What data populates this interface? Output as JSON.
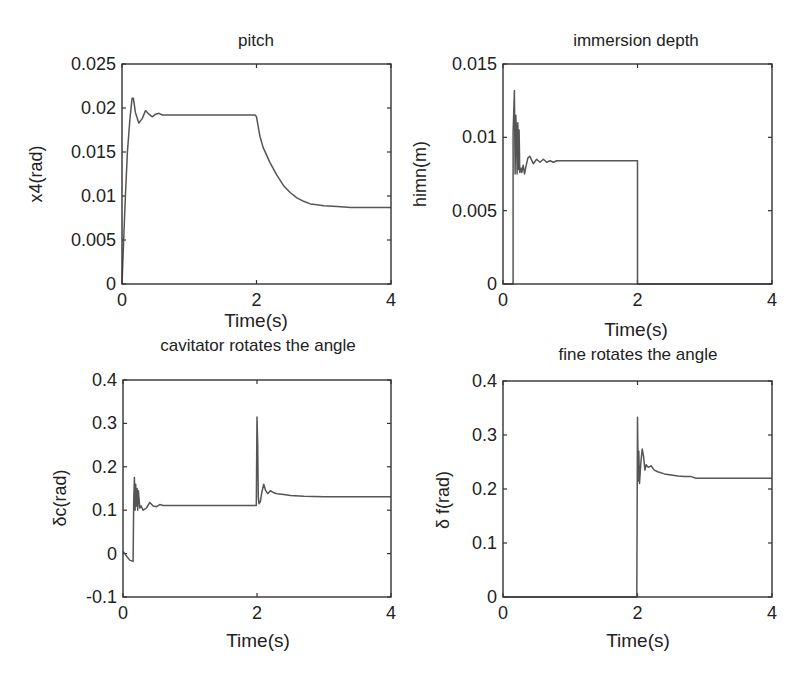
{
  "chart_data": [
    {
      "type": "line",
      "title": "pitch",
      "xlabel": "Time(s)",
      "ylabel": "x4(rad)",
      "xlim": [
        0,
        4
      ],
      "ylim": [
        0,
        0.025
      ],
      "xticks": [
        "0",
        "2",
        "4"
      ],
      "yticks": [
        "0",
        "0.005",
        "0.01",
        "0.015",
        "0.02",
        "0.025"
      ],
      "grid": false,
      "series": [
        {
          "name": "x4",
          "x": [
            0,
            0.03,
            0.05,
            0.08,
            0.12,
            0.15,
            0.17,
            0.2,
            0.25,
            0.3,
            0.35,
            0.4,
            0.45,
            0.5,
            0.55,
            0.6,
            0.7,
            1.0,
            1.5,
            1.98,
            2.0,
            2.05,
            2.1,
            2.2,
            2.3,
            2.4,
            2.5,
            2.6,
            2.7,
            2.8,
            2.9,
            3.0,
            3.2,
            3.4,
            3.6,
            4.0
          ],
          "y": [
            0,
            0.006,
            0.01,
            0.015,
            0.019,
            0.0211,
            0.0211,
            0.0195,
            0.0183,
            0.0188,
            0.0197,
            0.0193,
            0.019,
            0.0193,
            0.0194,
            0.0192,
            0.0192,
            0.0192,
            0.0192,
            0.0192,
            0.019,
            0.0168,
            0.0155,
            0.0138,
            0.0124,
            0.0112,
            0.0104,
            0.0098,
            0.0094,
            0.0091,
            0.009,
            0.0089,
            0.0088,
            0.0087,
            0.0087,
            0.0087
          ]
        }
      ]
    },
    {
      "type": "line",
      "title": "immersion depth",
      "xlabel": "Time(s)",
      "ylabel": "himn(m)",
      "xlim": [
        0,
        4
      ],
      "ylim": [
        0,
        0.015
      ],
      "xticks": [
        "0",
        "2",
        "4"
      ],
      "yticks": [
        "0",
        "0.005",
        "0.01",
        "0.015"
      ],
      "grid": false,
      "series": [
        {
          "name": "himn",
          "x": [
            0,
            0.15,
            0.15,
            0.17,
            0.18,
            0.19,
            0.2,
            0.21,
            0.22,
            0.23,
            0.24,
            0.25,
            0.27,
            0.28,
            0.3,
            0.32,
            0.34,
            0.37,
            0.4,
            0.45,
            0.5,
            0.55,
            0.6,
            0.65,
            0.7,
            0.75,
            0.8,
            0.9,
            1.2,
            1.6,
            2.0,
            2.0,
            4.0
          ],
          "y": [
            0,
            0,
            0.0103,
            0.0132,
            0.0075,
            0.0115,
            0.0103,
            0.0075,
            0.011,
            0.0078,
            0.0105,
            0.0076,
            0.0079,
            0.0076,
            0.0081,
            0.0075,
            0.008,
            0.0086,
            0.0087,
            0.0082,
            0.0085,
            0.0083,
            0.0085,
            0.0083,
            0.0084,
            0.0083,
            0.0084,
            0.0084,
            0.0084,
            0.0084,
            0.0084,
            0,
            0
          ]
        }
      ]
    },
    {
      "type": "line",
      "title": "cavitator rotates the angle",
      "xlabel": "Time(s)",
      "ylabel": "δc(rad)",
      "xlim": [
        0,
        4
      ],
      "ylim": [
        -0.1,
        0.4
      ],
      "xticks": [
        "0",
        "2",
        "4"
      ],
      "yticks": [
        "-0.1",
        "0",
        "0.1",
        "0.2",
        "0.3",
        "0.4"
      ],
      "grid": false,
      "series": [
        {
          "name": "δc",
          "x": [
            0,
            0.05,
            0.1,
            0.15,
            0.16,
            0.17,
            0.18,
            0.19,
            0.2,
            0.21,
            0.22,
            0.23,
            0.25,
            0.27,
            0.3,
            0.35,
            0.4,
            0.45,
            0.5,
            0.55,
            0.6,
            0.65,
            1.0,
            1.5,
            1.99,
            2.0,
            2.01,
            2.02,
            2.03,
            2.05,
            2.07,
            2.1,
            2.13,
            2.16,
            2.2,
            2.25,
            2.3,
            2.4,
            2.5,
            2.7,
            3.0,
            3.5,
            4.0
          ],
          "y": [
            0.005,
            -0.005,
            -0.015,
            -0.018,
            0.12,
            0.175,
            0.1,
            0.16,
            0.11,
            0.15,
            0.1,
            0.145,
            0.105,
            0.11,
            0.1,
            0.105,
            0.118,
            0.11,
            0.108,
            0.113,
            0.111,
            0.111,
            0.111,
            0.111,
            0.111,
            0.315,
            0.25,
            0.13,
            0.115,
            0.12,
            0.14,
            0.16,
            0.145,
            0.138,
            0.145,
            0.14,
            0.138,
            0.136,
            0.134,
            0.132,
            0.131,
            0.131,
            0.131
          ]
        }
      ]
    },
    {
      "type": "line",
      "title": "fine rotates the angle",
      "xlabel": "Time(s)",
      "ylabel": "δ f(rad)",
      "xlim": [
        0,
        4
      ],
      "ylim": [
        0,
        0.4
      ],
      "xticks": [
        "0",
        "2",
        "4"
      ],
      "yticks": [
        "0",
        "0.1",
        "0.2",
        "0.3",
        "0.4"
      ],
      "grid": false,
      "series": [
        {
          "name": "δf",
          "x": [
            0,
            1.99,
            2.0,
            2.01,
            2.02,
            2.03,
            2.05,
            2.07,
            2.09,
            2.11,
            2.13,
            2.16,
            2.2,
            2.25,
            2.3,
            2.4,
            2.5,
            2.6,
            2.7,
            2.8,
            2.87,
            3.0,
            3.5,
            4.0
          ],
          "y": [
            0,
            0,
            0.333,
            0.215,
            0.27,
            0.21,
            0.25,
            0.274,
            0.26,
            0.235,
            0.245,
            0.24,
            0.243,
            0.235,
            0.232,
            0.228,
            0.226,
            0.224,
            0.223,
            0.223,
            0.22,
            0.22,
            0.22,
            0.22
          ]
        }
      ]
    }
  ],
  "panels": [
    {
      "title": "pitch",
      "ylabel": "x4(rad)",
      "xlabel": "Time(s)"
    },
    {
      "title": "immersion depth",
      "ylabel": "himn(m)",
      "xlabel": "Time(s)"
    },
    {
      "title": "cavitator rotates the angle",
      "ylabel": "δc(rad)",
      "xlabel": "Time(s)"
    },
    {
      "title": "fine rotates the angle",
      "ylabel": "δ f(rad)",
      "xlabel": "Time(s)"
    }
  ]
}
